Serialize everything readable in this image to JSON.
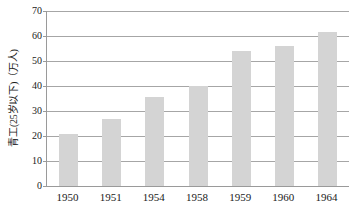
{
  "chart_data": {
    "type": "bar",
    "title": "",
    "subtitle": "",
    "xlabel": "",
    "ylabel": "青工(25岁以下)（万人)",
    "categories": [
      "1950",
      "1951",
      "1954",
      "1958",
      "1959",
      "1960",
      "1964"
    ],
    "values": [
      21,
      27,
      35.5,
      40,
      54,
      56,
      61.5
    ],
    "series": [
      {
        "name": "青工(25岁以下)（万人)",
        "values": [
          21,
          27,
          35.5,
          40,
          54,
          56,
          61.5
        ]
      }
    ],
    "ylim": [
      0,
      70
    ],
    "yticks": [
      0,
      10,
      20,
      30,
      40,
      50,
      60,
      70
    ],
    "ytick_labels": [
      "0",
      "10",
      "20",
      "30",
      "40",
      "50",
      "60",
      "70"
    ],
    "grid": true,
    "grid_axis": "y",
    "legend": false,
    "legend_position": "none",
    "annotations": [],
    "colors": {
      "bar_fill": "#d4d4d4",
      "gridline": "#a6a6a6",
      "axis_line": "#9a9a9a",
      "text": "#1a1a1a",
      "background": "#ffffff"
    }
  }
}
